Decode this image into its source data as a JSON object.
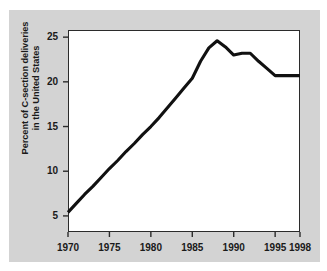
{
  "chart_data": {
    "type": "line",
    "title": "",
    "xlabel": "",
    "ylabel": "Percent of C-section deliveries in the United States",
    "ylabel_line1": "Percent of C-section deliveries",
    "ylabel_line2": "in the United States",
    "xlim": [
      1970,
      1998
    ],
    "ylim": [
      3.2,
      25.8
    ],
    "xticks": [
      1970,
      1975,
      1980,
      1985,
      1990,
      1995,
      1998
    ],
    "xtick_labels": [
      "1970",
      "1975",
      "1980",
      "1985",
      "1990",
      "1995",
      "1998"
    ],
    "yticks": [
      5,
      10,
      15,
      20,
      25
    ],
    "ytick_labels": [
      "5",
      "10",
      "15",
      "20",
      "25"
    ],
    "grid": false,
    "legend": false,
    "line_color": "#111111",
    "plot_bg": "#ffffff",
    "figure_bg": "#d3d3d3",
    "x": [
      1970,
      1971,
      1972,
      1973,
      1974,
      1975,
      1976,
      1977,
      1978,
      1979,
      1980,
      1981,
      1982,
      1983,
      1984,
      1985,
      1986,
      1987,
      1988,
      1989,
      1990,
      1991,
      1992,
      1993,
      1994,
      1995,
      1996,
      1997,
      1998
    ],
    "values": [
      5.4,
      6.4,
      7.4,
      8.3,
      9.3,
      10.3,
      11.2,
      12.2,
      13.1,
      14.1,
      15.0,
      16.0,
      17.1,
      18.2,
      19.3,
      20.4,
      22.3,
      23.8,
      24.6,
      23.9,
      23.0,
      23.2,
      23.2,
      22.3,
      21.5,
      20.7,
      20.7,
      20.7,
      20.7
    ]
  }
}
